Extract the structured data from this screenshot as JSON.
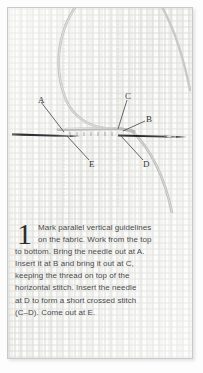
{
  "figure": {
    "type": "stitch-diagram",
    "fabric_label": "woven-fabric-texture",
    "point_labels": [
      {
        "id": "A",
        "text": "A",
        "x": 38,
        "y": 97,
        "leader_to_x": 64,
        "leader_to_y": 128
      },
      {
        "id": "C",
        "text": "C",
        "x": 127,
        "y": 93,
        "leader_to_x": 114,
        "leader_to_y": 126
      },
      {
        "id": "B",
        "text": "B",
        "x": 147,
        "y": 116,
        "leader_to_x": 120,
        "leader_to_y": 128
      },
      {
        "id": "E",
        "text": "E",
        "x": 88,
        "y": 161,
        "leader_to_x": 66,
        "leader_to_y": 134
      },
      {
        "id": "D",
        "text": "D",
        "x": 143,
        "y": 161,
        "leader_to_x": 120,
        "leader_to_y": 134
      }
    ],
    "elements": [
      "needle-left",
      "needle-right",
      "thread-loop-upper",
      "thread-loop-right",
      "guideline-left",
      "guideline-right",
      "horizontal-stitch"
    ]
  },
  "caption": {
    "step_number": "1",
    "lines": [
      "Mark parallel vertical guidelines",
      "on the fabric. Work from the top",
      "to bottom. Bring the needle out at A.",
      "Insert it at B and bring it out at C,",
      "keeping the thread on top of the",
      "horizontal stitch. Insert the needle",
      "at D to form a short crossed stitch",
      "(C–D). Come out at E."
    ],
    "full_text": "Mark parallel vertical guidelines on the fabric. Work from the top to bottom. Bring the needle out at A. Insert it at B and bring it out at C, keeping the thread on top of the horizontal stitch. Insert the needle at D to form a short crossed stitch (C–D). Come out at E."
  },
  "colors": {
    "page_background": "#ffffff",
    "frame_background": "#fbfbfa",
    "frame_border": "#c9c9c9",
    "text": "#4a4a4c",
    "label_text": "#38383a",
    "dropcap": "#2b2b2d",
    "needle": "#2e2e30",
    "thread": "#b6b6b4",
    "guideline": "#d3d3d1"
  }
}
